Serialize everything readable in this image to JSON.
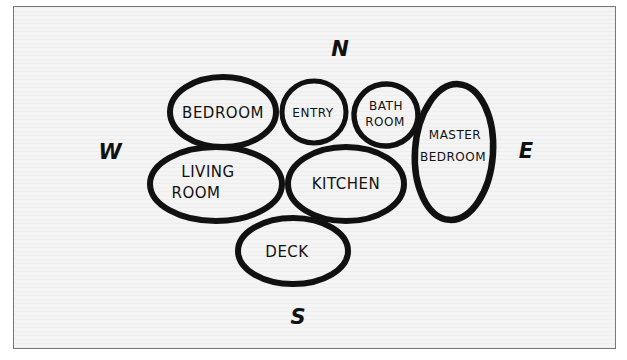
{
  "diagram": {
    "type": "bubble-diagram",
    "compass": {
      "north": "N",
      "south": "S",
      "east": "E",
      "west": "W"
    },
    "rooms": [
      {
        "id": "bedroom",
        "lines": [
          "Bedroom"
        ]
      },
      {
        "id": "entry",
        "lines": [
          "Entry"
        ]
      },
      {
        "id": "bathroom",
        "lines": [
          "Bath",
          "Room"
        ]
      },
      {
        "id": "master-bedroom",
        "lines": [
          "Master",
          "Bedroom"
        ]
      },
      {
        "id": "living-room",
        "lines": [
          "Living",
          "Room"
        ]
      },
      {
        "id": "kitchen",
        "lines": [
          "Kitchen"
        ]
      },
      {
        "id": "deck",
        "lines": [
          "Deck"
        ]
      }
    ],
    "colors": {
      "ink": "#111111",
      "paper": "#f4f4f4",
      "frame": "#777777"
    }
  },
  "labels": {
    "bedroom": "BEDROOM",
    "entry": "ENTRY",
    "bath_1": "BATH",
    "bath_2": "ROOM",
    "master_1": "MASTER",
    "master_2": "BEDROOM",
    "living_1": "LIVING",
    "living_2": "ROOM",
    "kitchen": "KITCHEN",
    "deck": "DECK"
  }
}
